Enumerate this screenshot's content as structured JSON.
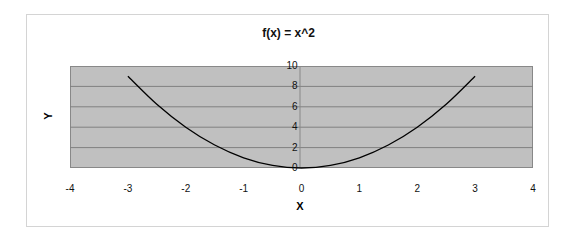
{
  "chart_data": {
    "type": "line",
    "title": "f(x) = x^2",
    "xlabel": "X",
    "ylabel": "Y",
    "xlim": [
      -4,
      4
    ],
    "ylim": [
      0,
      10
    ],
    "x_ticks": [
      "-4",
      "-3",
      "-2",
      "-1",
      "0",
      "1",
      "2",
      "3",
      "4"
    ],
    "y_ticks": [
      "0",
      "2",
      "4",
      "6",
      "8",
      "10"
    ],
    "grid": {
      "horizontal": true,
      "vertical": false
    },
    "legend": null,
    "plot_background": "#c0c0c0",
    "line_color": "#000000",
    "series": [
      {
        "name": "f(x) = x^2",
        "x": [
          -3,
          -2.5,
          -2,
          -1.5,
          -1,
          -0.5,
          0,
          0.5,
          1,
          1.5,
          2,
          2.5,
          3
        ],
        "values": [
          9,
          6.25,
          4,
          2.25,
          1,
          0.25,
          0,
          0.25,
          1,
          2.25,
          4,
          6.25,
          9
        ]
      }
    ]
  }
}
